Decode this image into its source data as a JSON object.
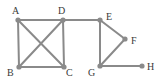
{
  "diagram": {
    "type": "undirected-graph",
    "colors": {
      "edge": "#8a8a8a",
      "node": "#8a8a8a",
      "label": "#3a3a3a",
      "background": "#ffffff"
    },
    "nodes": [
      {
        "id": "A",
        "label": "A",
        "x": 18,
        "y": 20,
        "lx": 12,
        "ly": 14
      },
      {
        "id": "B",
        "label": "B",
        "x": 19,
        "y": 67,
        "lx": 7,
        "ly": 76
      },
      {
        "id": "C",
        "label": "C",
        "x": 64,
        "y": 67,
        "lx": 66,
        "ly": 76
      },
      {
        "id": "D",
        "label": "D",
        "x": 63,
        "y": 20,
        "lx": 58,
        "ly": 14
      },
      {
        "id": "E",
        "label": "E",
        "x": 100,
        "y": 20,
        "lx": 106,
        "ly": 20
      },
      {
        "id": "F",
        "label": "F",
        "x": 125,
        "y": 39,
        "lx": 131,
        "ly": 44
      },
      {
        "id": "G",
        "label": "G",
        "x": 100,
        "y": 66,
        "lx": 88,
        "ly": 76
      },
      {
        "id": "H",
        "label": "H",
        "x": 142,
        "y": 66,
        "lx": 147,
        "ly": 70
      }
    ],
    "edges": [
      [
        "A",
        "D"
      ],
      [
        "A",
        "B"
      ],
      [
        "A",
        "C"
      ],
      [
        "B",
        "C"
      ],
      [
        "B",
        "D"
      ],
      [
        "D",
        "C"
      ],
      [
        "D",
        "E"
      ],
      [
        "E",
        "F"
      ],
      [
        "E",
        "G"
      ],
      [
        "F",
        "G"
      ],
      [
        "G",
        "H"
      ]
    ]
  }
}
